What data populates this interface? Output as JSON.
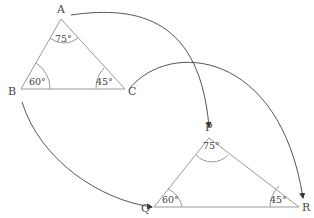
{
  "figure": {
    "triangle1": {
      "vertices": {
        "A": "A",
        "B": "B",
        "C": "C"
      },
      "angles": {
        "A": "75°",
        "B": "60°",
        "C": "45°"
      }
    },
    "triangle2": {
      "vertices": {
        "P": "P",
        "Q": "Q",
        "R": "R"
      },
      "angles": {
        "P": "75°",
        "Q": "60°",
        "R": "45°"
      }
    },
    "mappings": [
      {
        "from": "A",
        "to": "P"
      },
      {
        "from": "B",
        "to": "Q"
      },
      {
        "from": "C",
        "to": "R"
      }
    ],
    "colors": {
      "line": "#888888",
      "arrow": "#333333",
      "text": "#444444"
    }
  }
}
